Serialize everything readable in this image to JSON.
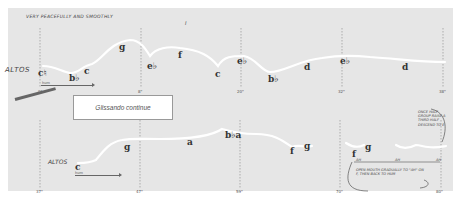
{
  "score": {
    "tempo_marking": "VERY PEACEFULLY AND SMOOTHLY",
    "section_mark": "I",
    "instruction_box": "Glissando continue",
    "system1": {
      "voice_label": "ALTOS",
      "dynamic": "hum",
      "pitches": [
        {
          "name": "c♮",
          "x": 40,
          "y": 72
        },
        {
          "name": "b♭",
          "x": 70,
          "y": 77
        },
        {
          "name": "c",
          "x": 84,
          "y": 70
        },
        {
          "name": "g",
          "x": 121,
          "y": 46
        },
        {
          "name": "e♭",
          "x": 150,
          "y": 66
        },
        {
          "name": "f",
          "x": 178,
          "y": 54
        },
        {
          "name": "c",
          "x": 217,
          "y": 73
        },
        {
          "name": "e♭",
          "x": 238,
          "y": 60
        },
        {
          "name": "b♭",
          "x": 269,
          "y": 78
        },
        {
          "name": "d",
          "x": 304,
          "y": 66
        },
        {
          "name": "e♭",
          "x": 341,
          "y": 60
        },
        {
          "name": "d",
          "x": 404,
          "y": 66
        }
      ],
      "times": [
        "0\"",
        "8\"",
        "20\"",
        "32\"",
        "38\""
      ]
    },
    "system2": {
      "voice_label": "ALTOS",
      "dynamic": "hum",
      "pitches": [
        {
          "name": "c",
          "x": 77,
          "y": 166
        },
        {
          "name": "g",
          "x": 125,
          "y": 146
        },
        {
          "name": "a",
          "x": 188,
          "y": 141
        },
        {
          "name": "b♭a",
          "x": 228,
          "y": 134
        },
        {
          "name": "f",
          "x": 291,
          "y": 150
        },
        {
          "name": "g",
          "x": 305,
          "y": 145
        },
        {
          "name": "f",
          "x": 352,
          "y": 153
        },
        {
          "name": "g",
          "x": 365,
          "y": 146
        }
      ],
      "times": [
        "37\"",
        "47\"",
        "59\"",
        "70\"",
        "80\""
      ],
      "annotation_top": "ONCE HALF GROUP RAISE A THIRD HALF DESCEND TO E",
      "annotation_bottom": "OPEN MOUTH GRADUALLY TO \"AH\" ON F, THEN BACK TO HUM",
      "ah_marks": [
        "AH",
        "AH",
        "AH"
      ]
    }
  }
}
